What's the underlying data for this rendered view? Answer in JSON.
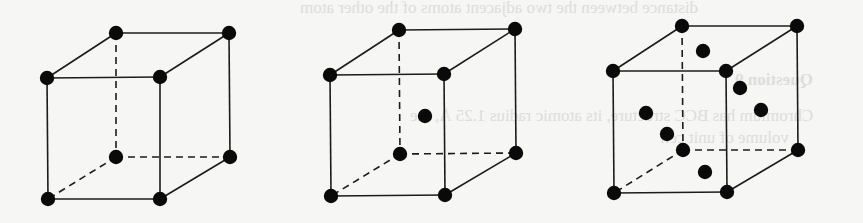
{
  "figure": {
    "background_color": "#f6f6f4",
    "line_color": "#1c1c1c",
    "atom_color": "#0a0a0a",
    "cells": [
      {
        "name": "simple-cubic",
        "corners": {
          "btl": [
            116,
            33
          ],
          "btr": [
            229,
            33
          ],
          "ftl": [
            47,
            78
          ],
          "ftr": [
            160,
            77
          ],
          "bbl": [
            116,
            157
          ],
          "bbr": [
            230,
            157
          ],
          "fbl": [
            48,
            199
          ],
          "fbr": [
            160,
            199
          ]
        },
        "extra_atoms": []
      },
      {
        "name": "body-centered-cubic",
        "corners": {
          "btl": [
            399,
            30
          ],
          "btr": [
            515,
            29
          ],
          "ftl": [
            330,
            75
          ],
          "ftr": [
            444,
            74
          ],
          "bbl": [
            400,
            154
          ],
          "bbr": [
            516,
            153
          ],
          "fbl": [
            331,
            196
          ],
          "fbr": [
            445,
            195
          ]
        },
        "extra_atoms": [
          [
            425,
            116
          ]
        ]
      },
      {
        "name": "face-centered-cubic",
        "corners": {
          "btl": [
            682,
            26
          ],
          "btr": [
            797,
            26
          ],
          "ftl": [
            613,
            71
          ],
          "ftr": [
            726,
            71
          ],
          "bbl": [
            683,
            150
          ],
          "bbr": [
            798,
            150
          ],
          "fbl": [
            614,
            193
          ],
          "fbr": [
            727,
            192
          ]
        },
        "extra_atoms": [
          [
            703,
            51
          ],
          [
            740,
            88
          ],
          [
            761,
            110
          ],
          [
            646,
            113
          ],
          [
            667,
            134
          ],
          [
            705,
            172
          ]
        ]
      }
    ]
  },
  "bleed_through_text": {
    "line1": "distance between the two adjacent atoms of the other atom",
    "line2": "Question 9",
    "line3": "Chromium has BCC structure, its atomic radius 1.25 Å, the",
    "line4": "volume of unit cell"
  }
}
